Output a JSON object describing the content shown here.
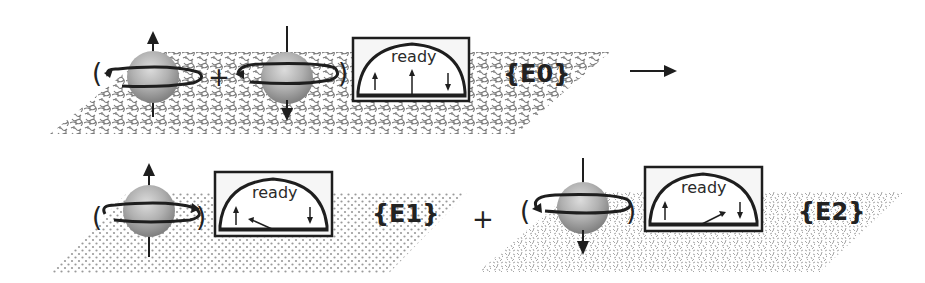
{
  "diagram": {
    "type": "quantum-measurement-illustration",
    "top_row": {
      "state_label": "{E0}",
      "spin_superposition": {
        "open_paren": "(",
        "close_paren": ")",
        "operator": "+",
        "spins": [
          {
            "name": "spin-up",
            "arrow": "up",
            "rotation": "counter-clockwise"
          },
          {
            "name": "spin-down",
            "arrow": "down",
            "rotation": "clockwise"
          }
        ]
      },
      "meter": {
        "label": "ready",
        "needle": "center (ready)",
        "left_mark": "↑",
        "right_mark": "↓"
      },
      "texture": "maze",
      "transition_arrow": "→"
    },
    "bottom_row": {
      "operator": "+",
      "branches": [
        {
          "state_label": "{E1}",
          "spin": {
            "arrow": "up",
            "rotation": "counter-clockwise"
          },
          "open_paren": "(",
          "close_paren": ")",
          "meter": {
            "label": "ready",
            "needle": "points to ↑",
            "left_mark": "↑",
            "right_mark": "↓"
          },
          "texture": "dots"
        },
        {
          "state_label": "{E2}",
          "spin": {
            "arrow": "down",
            "rotation": "clockwise"
          },
          "open_paren": "(",
          "close_paren": ")",
          "meter": {
            "label": "ready",
            "needle": "points to ↓",
            "left_mark": "↑",
            "right_mark": "↓"
          },
          "texture": "speckle"
        }
      ]
    },
    "colors": {
      "ink": "#1e1e1e",
      "sphere_light": "#d8d8d8",
      "sphere_dark": "#8a8a8a",
      "texture": "#8c8c8c",
      "meter_bg": "#ffffff",
      "box_bg": "#f4f4f4"
    }
  }
}
